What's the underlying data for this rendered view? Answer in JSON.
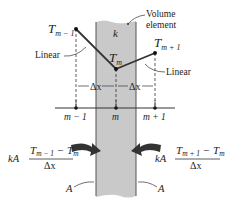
{
  "diagram": {
    "slab": {
      "label_k": "k",
      "volume_label_line1": "Volume",
      "volume_label_line2": "element",
      "fill": "#c9c9c9"
    },
    "temperatures": {
      "left": {
        "T": "T",
        "sub": "m − 1"
      },
      "mid": {
        "T": "T",
        "sub": "m"
      },
      "right": {
        "T": "T",
        "sub": "m + 1"
      }
    },
    "linear_left": "Linear",
    "linear_right": "Linear",
    "dx_left": "Δx",
    "dx_right": "Δx",
    "nodes": [
      "m − 1",
      "m",
      "m + 1"
    ],
    "flux_left": {
      "coef": "kA",
      "num_T1": "T",
      "num_sub1": "m − 1",
      "minus": " − ",
      "num_T2": "T",
      "num_sub2": "m",
      "den": "Δx"
    },
    "flux_right": {
      "coef": "kA",
      "num_T1": "T",
      "num_sub1": "m + 1",
      "minus": " − ",
      "num_T2": "T",
      "num_sub2": "m",
      "den": "Δx"
    },
    "area_left": "A",
    "area_right": "A"
  }
}
